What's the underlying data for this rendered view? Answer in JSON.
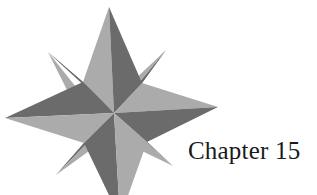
{
  "heading": {
    "chapter_label": "Chapter 15"
  },
  "graphic": {
    "icon": "compass-rose-icon",
    "colors": {
      "light_face": "#ababab",
      "dark_face": "#6b6b6b",
      "background": "#ffffff",
      "text": "#1a1a1a"
    }
  }
}
